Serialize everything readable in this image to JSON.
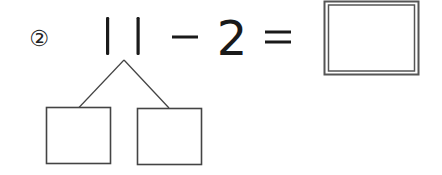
{
  "problem": {
    "number_label": "②",
    "minuend": "11",
    "operator": "−",
    "subtrahend": "2",
    "equals": "=",
    "answer": ""
  },
  "decomposition": {
    "left_box": "",
    "right_box": ""
  },
  "colors": {
    "ink": "#222222",
    "box_stroke": "#444444",
    "background": "#ffffff"
  }
}
